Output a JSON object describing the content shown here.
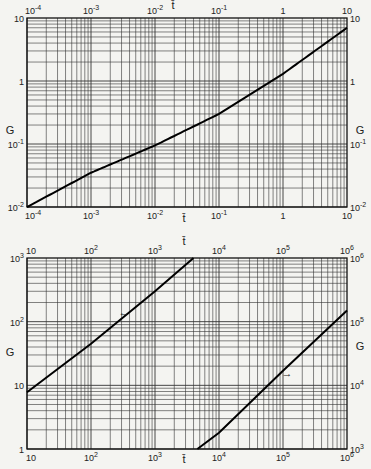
{
  "chart_data": [
    {
      "type": "line",
      "title": "",
      "xlabel": "t̄",
      "ylabel": "G",
      "xscale": "log",
      "yscale": "log",
      "xlim": [
        0.0001,
        10
      ],
      "ylim": [
        0.01,
        10
      ],
      "x_ticks": [
        "10^-4",
        "10^-3",
        "10^-2",
        "10^-1",
        "1",
        "10"
      ],
      "y_ticks_left": [
        "10^-2",
        "10^-1",
        "1",
        "10"
      ],
      "y_ticks_right": [
        "10^-2",
        "10^-1",
        "1",
        "10"
      ],
      "grid": true,
      "series": [
        {
          "name": "G(t̄)",
          "x": [
            0.0001,
            0.001,
            0.01,
            0.1,
            1,
            10
          ],
          "y": [
            0.01,
            0.035,
            0.095,
            0.3,
            1.3,
            7
          ]
        }
      ]
    },
    {
      "type": "line",
      "title": "",
      "xlabel": "t̄",
      "ylabel": "G",
      "xscale": "log",
      "yscale": "log",
      "xlim": [
        10,
        1000000
      ],
      "ylim_left": [
        1,
        1000
      ],
      "ylim_right": [
        1000,
        1000000
      ],
      "x_ticks": [
        "10",
        "10^2",
        "10^3",
        "10^4",
        "10^5",
        "10^6"
      ],
      "y_ticks_left": [
        "1",
        "10",
        "10^2",
        "10^3"
      ],
      "y_ticks_right": [
        "10^3",
        "10^4",
        "10^5",
        "10^6"
      ],
      "grid": true,
      "series": [
        {
          "name": "G (left axis)",
          "axis": "left",
          "arrow": "←",
          "x": [
            10,
            100,
            1000,
            4000
          ],
          "y": [
            7.8,
            45,
            300,
            1000
          ]
        },
        {
          "name": "G (right axis)",
          "axis": "right",
          "arrow": "→",
          "x": [
            4600,
            10000,
            100000,
            1000000
          ],
          "y": [
            1000,
            1800,
            17000,
            150000
          ]
        }
      ]
    }
  ],
  "top": {
    "xlabel": "t̄",
    "ylabel_left": "G",
    "ylabel_right": "G",
    "x_ticks": [
      {
        "base": "10",
        "exp": "-4"
      },
      {
        "base": "10",
        "exp": "-3"
      },
      {
        "base": "10",
        "exp": "-2"
      },
      {
        "base": "10",
        "exp": "-1"
      },
      {
        "base": "1",
        "exp": ""
      },
      {
        "base": "10",
        "exp": ""
      }
    ],
    "y_ticks": [
      {
        "base": "10",
        "exp": ""
      },
      {
        "base": "1",
        "exp": ""
      },
      {
        "base": "10",
        "exp": "-1"
      },
      {
        "base": "10",
        "exp": "-2"
      }
    ]
  },
  "bottom": {
    "xlabel": "t̄",
    "ylabel_left": "G",
    "ylabel_right": "G",
    "x_ticks": [
      {
        "base": "10",
        "exp": ""
      },
      {
        "base": "10",
        "exp": "2"
      },
      {
        "base": "10",
        "exp": "3"
      },
      {
        "base": "10",
        "exp": "4"
      },
      {
        "base": "10",
        "exp": "5"
      },
      {
        "base": "10",
        "exp": "6"
      }
    ],
    "y_ticks_left": [
      {
        "base": "10",
        "exp": "3"
      },
      {
        "base": "10",
        "exp": "2"
      },
      {
        "base": "10",
        "exp": ""
      },
      {
        "base": "1",
        "exp": ""
      }
    ],
    "y_ticks_right": [
      {
        "base": "10",
        "exp": "6"
      },
      {
        "base": "10",
        "exp": "5"
      },
      {
        "base": "10",
        "exp": "4"
      },
      {
        "base": "10",
        "exp": "3"
      }
    ],
    "arrow_left": "←",
    "arrow_right": "→"
  }
}
